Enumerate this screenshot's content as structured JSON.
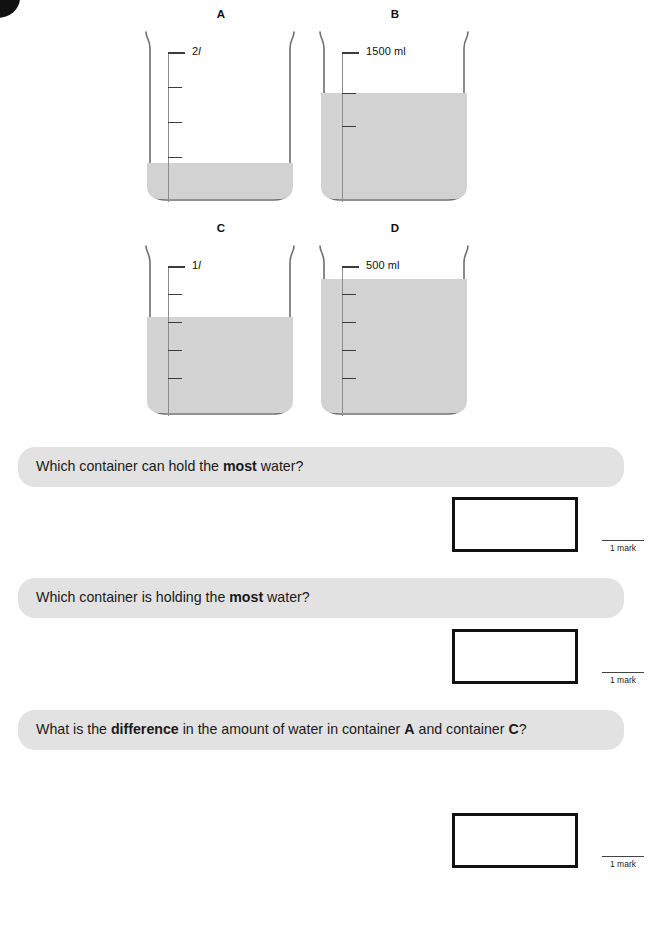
{
  "page": {
    "background": "#ffffff",
    "water_color": "#d2d2d2",
    "banner_color": "#e2e2e2",
    "box_border_color": "#111111"
  },
  "containers": [
    {
      "label": "A",
      "scale_caption": "2",
      "scale_unit": "l",
      "unit_style": "italic",
      "tick_count": 4,
      "water_level_percent": 22
    },
    {
      "label": "B",
      "scale_caption": "1500",
      "scale_unit": "ml",
      "unit_style": "normal",
      "tick_count": 3,
      "water_level_percent": 62
    },
    {
      "label": "C",
      "scale_caption": "1",
      "scale_unit": "l",
      "unit_style": "italic",
      "tick_count": 5,
      "water_level_percent": 57
    },
    {
      "label": "D",
      "scale_caption": "500",
      "scale_unit": "ml",
      "unit_style": "normal",
      "tick_count": 5,
      "water_level_percent": 79
    }
  ],
  "questions": [
    {
      "prefix": "Which container can hold the ",
      "emphasis": "most",
      "suffix": " water?",
      "mark": "1 mark"
    },
    {
      "prefix": "Which container is holding the ",
      "emphasis": "most",
      "suffix": " water?",
      "mark": "1 mark"
    },
    {
      "prefix": "What is the ",
      "emphasis": "difference",
      "suffix": " in the amount of water in container ",
      "ref_a": "A",
      "mid": " and container ",
      "ref_b": "C",
      "tail": "?",
      "mark": "1 mark"
    }
  ]
}
